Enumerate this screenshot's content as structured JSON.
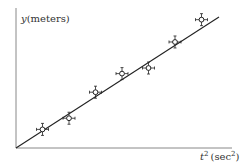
{
  "chart_data": {
    "type": "scatter",
    "title": "",
    "xlabel": "t² (sec²)",
    "ylabel": "y (meters)",
    "axes": {
      "y_label_var": "y",
      "y_label_unit": "(meters)",
      "x_label_var": "t",
      "x_label_exp": "2",
      "x_label_unit_open": "(sec",
      "x_label_unit_exp": "2",
      "x_label_unit_close": ")"
    },
    "grid": false,
    "legend": null,
    "points": [
      {
        "x": 1,
        "y": 1.0
      },
      {
        "x": 2,
        "y": 1.6
      },
      {
        "x": 3,
        "y": 3.0
      },
      {
        "x": 4,
        "y": 4.0
      },
      {
        "x": 5,
        "y": 4.3
      },
      {
        "x": 6,
        "y": 5.7
      },
      {
        "x": 7,
        "y": 6.9
      }
    ],
    "error_bars": true,
    "fit_line": {
      "slope": 0.96,
      "intercept": 0,
      "x_range": [
        0,
        7.2
      ]
    },
    "xlim": [
      0,
      7.5
    ],
    "ylim": [
      0,
      7.5
    ],
    "colors": {
      "axis": "#777777",
      "line": "#222222",
      "marker": "#222222"
    }
  }
}
